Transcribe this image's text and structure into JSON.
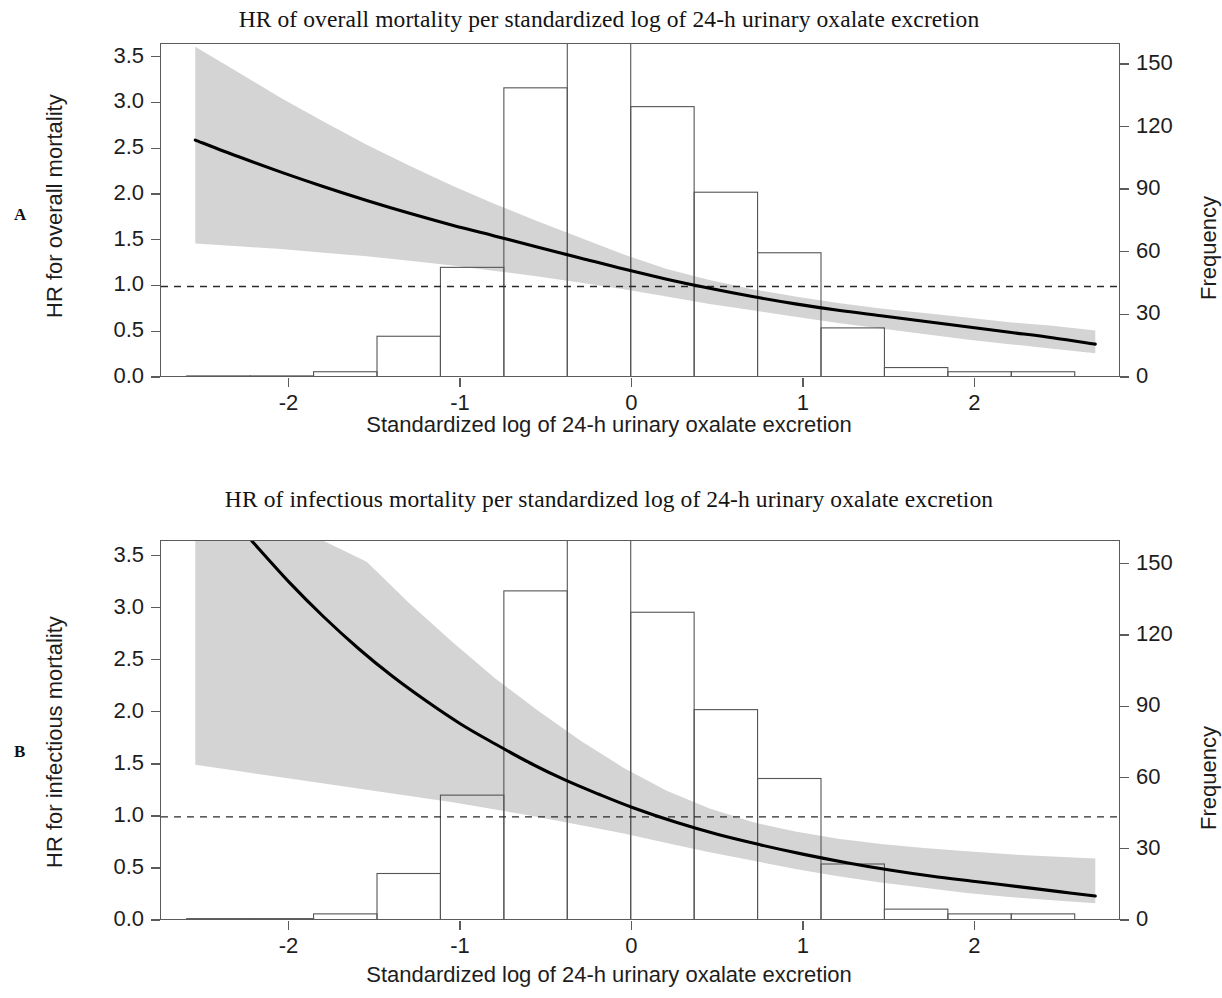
{
  "figure": {
    "panels": [
      {
        "letter": "A",
        "title": "HR of overall mortality per standardized log of 24-h urinary oxalate excretion",
        "ylabel_left": "HR for overall mortality",
        "ylabel_right": "Frequency",
        "xlabel": "Standardized log of 24-h urinary oxalate excretion"
      },
      {
        "letter": "B",
        "title": "HR of infectious mortality per standardized log of 24-h urinary oxalate excretion",
        "ylabel_left": "HR for infectious mortality",
        "ylabel_right": "Frequency",
        "xlabel": "Standardized log of 24-h urinary oxalate excretion"
      }
    ]
  },
  "chart_data": [
    {
      "type": "line",
      "panel": "A",
      "title": "HR of overall mortality per standardized log of 24-h urinary oxalate excretion",
      "xlabel": "Standardized log of 24-h urinary oxalate excretion",
      "ylabel": "HR for overall mortality",
      "ylabel_secondary": "Frequency",
      "xlim": [
        -2.75,
        2.85
      ],
      "ylim": [
        0.0,
        3.65
      ],
      "ylim_secondary": [
        0,
        160
      ],
      "xticks": [
        -2,
        -1,
        0,
        1,
        2
      ],
      "xticklabels": [
        "-2",
        "-1",
        "0",
        "1",
        "2"
      ],
      "yticks": [
        0.0,
        0.5,
        1.0,
        1.5,
        2.0,
        2.5,
        3.0,
        3.5
      ],
      "yticklabels": [
        "0.0",
        "0.5",
        "1.0",
        "1.5",
        "2.0",
        "2.5",
        "3.0",
        "3.5"
      ],
      "yticks_secondary": [
        0,
        30,
        60,
        90,
        120,
        150
      ],
      "yticklabels_secondary": [
        "0",
        "30",
        "60",
        "90",
        "120",
        "150"
      ],
      "grid": false,
      "legend": "none",
      "reference_line": {
        "y": 1.0,
        "style": "dashed",
        "label": "HR = 1.0"
      },
      "series": [
        {
          "name": "HR (fitted spline)",
          "style": "solid",
          "color": "#000000",
          "x": [
            -2.55,
            -2.3,
            -2.05,
            -1.8,
            -1.55,
            -1.3,
            -1.05,
            -0.8,
            -0.55,
            -0.3,
            -0.05,
            0.2,
            0.45,
            0.7,
            0.95,
            1.2,
            1.45,
            1.7,
            1.95,
            2.2,
            2.45,
            2.7
          ],
          "y": [
            2.6,
            2.42,
            2.25,
            2.09,
            1.94,
            1.8,
            1.67,
            1.55,
            1.43,
            1.31,
            1.19,
            1.08,
            0.98,
            0.89,
            0.81,
            0.74,
            0.68,
            0.62,
            0.56,
            0.5,
            0.44,
            0.37
          ]
        },
        {
          "name": "95% CI upper",
          "style": "shaded-band",
          "color": "#d4d4d4",
          "x": [
            -2.55,
            -2.3,
            -2.05,
            -1.8,
            -1.55,
            -1.3,
            -1.05,
            -0.8,
            -0.55,
            -0.3,
            -0.05,
            0.2,
            0.45,
            0.7,
            0.95,
            1.2,
            1.45,
            1.7,
            1.95,
            2.2,
            2.45,
            2.7
          ],
          "y": [
            3.62,
            3.34,
            3.06,
            2.8,
            2.55,
            2.32,
            2.1,
            1.9,
            1.71,
            1.53,
            1.35,
            1.19,
            1.07,
            0.97,
            0.89,
            0.82,
            0.76,
            0.71,
            0.66,
            0.61,
            0.57,
            0.52
          ]
        },
        {
          "name": "95% CI lower",
          "style": "shaded-band",
          "color": "#d4d4d4",
          "x": [
            -2.55,
            -2.3,
            -2.05,
            -1.8,
            -1.55,
            -1.3,
            -1.05,
            -0.8,
            -0.55,
            -0.3,
            -0.05,
            0.2,
            0.45,
            0.7,
            0.95,
            1.2,
            1.45,
            1.7,
            1.95,
            2.2,
            2.45,
            2.7
          ],
          "y": [
            1.47,
            1.44,
            1.41,
            1.37,
            1.33,
            1.28,
            1.23,
            1.17,
            1.11,
            1.04,
            0.97,
            0.89,
            0.81,
            0.74,
            0.67,
            0.6,
            0.54,
            0.48,
            0.42,
            0.37,
            0.32,
            0.27
          ]
        }
      ],
      "histogram": {
        "name": "Frequency of standardized log oxalate",
        "axis": "secondary",
        "bin_edges": [
          -2.6,
          -2.23,
          -1.86,
          -1.49,
          -1.12,
          -0.75,
          -0.38,
          -0.01,
          0.36,
          0.73,
          1.1,
          1.47,
          1.84,
          2.21,
          2.58
        ],
        "frequencies": [
          1,
          1,
          3,
          20,
          53,
          139,
          165,
          130,
          89,
          60,
          24,
          5,
          3,
          3
        ]
      }
    },
    {
      "type": "line",
      "panel": "B",
      "title": "HR of infectious mortality per standardized log of 24-h urinary oxalate excretion",
      "xlabel": "Standardized log of 24-h urinary oxalate excretion",
      "ylabel": "HR for infectious mortality",
      "ylabel_secondary": "Frequency",
      "xlim": [
        -2.75,
        2.85
      ],
      "ylim": [
        0.0,
        3.65
      ],
      "ylim_secondary": [
        0,
        160
      ],
      "xticks": [
        -2,
        -1,
        0,
        1,
        2
      ],
      "xticklabels": [
        "-2",
        "-1",
        "0",
        "1",
        "2"
      ],
      "yticks": [
        0.0,
        0.5,
        1.0,
        1.5,
        2.0,
        2.5,
        3.0,
        3.5
      ],
      "yticklabels": [
        "0.0",
        "0.5",
        "1.0",
        "1.5",
        "2.0",
        "2.5",
        "3.0",
        "3.5"
      ],
      "yticks_secondary": [
        0,
        30,
        60,
        90,
        120,
        150
      ],
      "yticklabels_secondary": [
        "0",
        "30",
        "60",
        "90",
        "120",
        "150"
      ],
      "grid": false,
      "legend": "none",
      "reference_line": {
        "y": 1.0,
        "style": "dashed",
        "label": "HR = 1.0"
      },
      "series": [
        {
          "name": "HR (fitted spline)",
          "style": "solid",
          "color": "#000000",
          "x": [
            -2.22,
            -2.0,
            -1.8,
            -1.6,
            -1.4,
            -1.2,
            -1.0,
            -0.8,
            -0.6,
            -0.4,
            -0.2,
            0.0,
            0.25,
            0.5,
            0.75,
            1.0,
            1.25,
            1.5,
            1.75,
            2.0,
            2.25,
            2.5,
            2.7
          ],
          "y": [
            3.65,
            3.25,
            2.92,
            2.62,
            2.35,
            2.11,
            1.89,
            1.7,
            1.52,
            1.36,
            1.22,
            1.09,
            0.95,
            0.83,
            0.73,
            0.64,
            0.56,
            0.49,
            0.43,
            0.38,
            0.33,
            0.28,
            0.24
          ]
        },
        {
          "name": "95% CI upper",
          "style": "shaded-band",
          "color": "#d4d4d4",
          "x": [
            -2.55,
            -2.3,
            -2.05,
            -1.8,
            -1.55,
            -1.3,
            -1.05,
            -0.8,
            -0.55,
            -0.3,
            -0.05,
            0.2,
            0.45,
            0.7,
            0.95,
            1.2,
            1.45,
            1.7,
            1.95,
            2.2,
            2.45,
            2.7
          ],
          "y": [
            3.65,
            3.65,
            3.65,
            3.65,
            3.45,
            3.05,
            2.68,
            2.33,
            2.02,
            1.73,
            1.47,
            1.25,
            1.08,
            0.95,
            0.86,
            0.79,
            0.74,
            0.7,
            0.67,
            0.64,
            0.62,
            0.6
          ]
        },
        {
          "name": "95% CI lower",
          "style": "shaded-band",
          "color": "#d4d4d4",
          "x": [
            -2.55,
            -2.3,
            -2.05,
            -1.8,
            -1.55,
            -1.3,
            -1.05,
            -0.8,
            -0.55,
            -0.3,
            -0.05,
            0.2,
            0.45,
            0.7,
            0.95,
            1.2,
            1.45,
            1.7,
            1.95,
            2.2,
            2.45,
            2.7
          ],
          "y": [
            1.5,
            1.44,
            1.38,
            1.32,
            1.26,
            1.2,
            1.14,
            1.07,
            1.0,
            0.92,
            0.84,
            0.75,
            0.66,
            0.58,
            0.5,
            0.43,
            0.37,
            0.32,
            0.27,
            0.23,
            0.2,
            0.17
          ]
        }
      ],
      "histogram": {
        "name": "Frequency of standardized log oxalate",
        "axis": "secondary",
        "bin_edges": [
          -2.6,
          -2.23,
          -1.86,
          -1.49,
          -1.12,
          -0.75,
          -0.38,
          -0.01,
          0.36,
          0.73,
          1.1,
          1.47,
          1.84,
          2.21,
          2.58
        ],
        "frequencies": [
          1,
          1,
          3,
          20,
          53,
          139,
          165,
          130,
          89,
          60,
          24,
          5,
          3,
          3
        ]
      }
    }
  ]
}
